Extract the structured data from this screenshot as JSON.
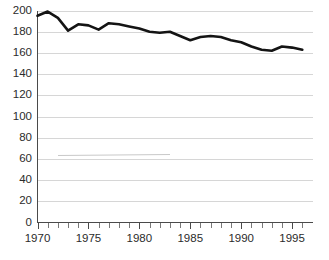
{
  "chart_data": {
    "type": "line",
    "title": "",
    "subtitle": "",
    "xlabel": "",
    "ylabel": "",
    "xlim": [
      1969.5,
      1996.5
    ],
    "ylim": [
      0,
      200
    ],
    "grid": true,
    "legend": "none",
    "y_ticks": [
      0,
      20,
      40,
      60,
      80,
      100,
      120,
      140,
      160,
      180,
      200
    ],
    "y_tick_labels": [
      "0",
      "20",
      "40",
      "60",
      "80",
      "100",
      "120",
      "140",
      "160",
      "180",
      "200"
    ],
    "x_ticks": [
      1970,
      1971,
      1972,
      1973,
      1974,
      1975,
      1976,
      1977,
      1978,
      1979,
      1980,
      1981,
      1982,
      1983,
      1984,
      1985,
      1986,
      1987,
      1988,
      1989,
      1990,
      1991,
      1992,
      1993,
      1994,
      1995,
      1996
    ],
    "x_tick_labels_major": [
      "1970",
      "1975",
      "1980",
      "1985",
      "1990",
      "1995"
    ],
    "x_major_ticks": [
      1970,
      1975,
      1980,
      1985,
      1990,
      1995
    ],
    "series": [
      {
        "name": "series-1",
        "color": "#141414",
        "x": [
          1970,
          1971,
          1972,
          1973,
          1974,
          1975,
          1976,
          1977,
          1978,
          1979,
          1980,
          1981,
          1982,
          1983,
          1984,
          1985,
          1986,
          1987,
          1988,
          1989,
          1990,
          1991,
          1992,
          1993,
          1994,
          1995,
          1996
        ],
        "values": [
          195,
          199,
          193,
          181,
          187,
          186,
          182,
          188,
          187,
          185,
          183,
          180,
          179,
          180,
          176,
          172,
          175,
          176,
          175,
          172,
          170,
          166,
          163,
          162,
          166,
          165,
          163
        ]
      }
    ],
    "annotations": []
  },
  "axes": {
    "y_axis_name": "y-axis",
    "x_axis_name": "x-axis"
  }
}
